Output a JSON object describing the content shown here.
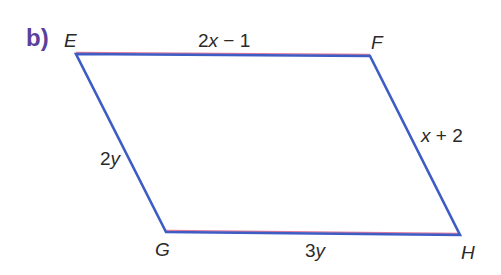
{
  "part_label": "b)",
  "shape": {
    "type": "parallelogram",
    "edge_color": "#3d5cc4",
    "edge_highlight_color": "#e07a9a",
    "vertices": {
      "E": {
        "label": "E",
        "x": 76,
        "y": 54
      },
      "F": {
        "label": "F",
        "x": 370,
        "y": 56
      },
      "H": {
        "label": "H",
        "x": 460,
        "y": 235
      },
      "G": {
        "label": "G",
        "x": 166,
        "y": 232
      }
    }
  },
  "sides": {
    "EF": "2x − 1",
    "FH": "x + 2",
    "EG": "2y",
    "GH": "3y"
  }
}
